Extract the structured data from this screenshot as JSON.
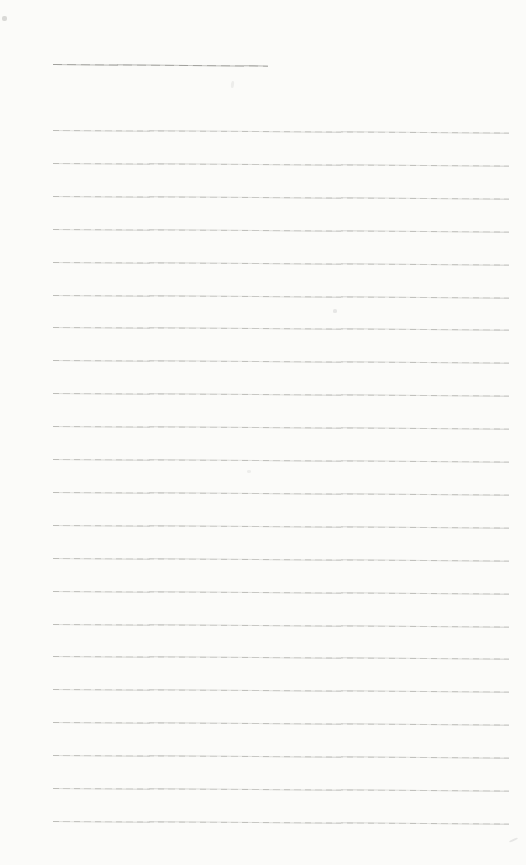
{
  "page": {
    "kind": "blank-lined-notebook-page",
    "width_px": 526,
    "height_px": 865,
    "background_color": "#fbfbf9",
    "rule_color": "#b2b2ad",
    "title_rule_color": "#9c9c97"
  },
  "title_line": {
    "x": 53,
    "y": 64,
    "width": 215,
    "tilt_deg": 0.45
  },
  "ruled_lines": {
    "count": 22,
    "x": 53,
    "width": 456,
    "first_y": 130,
    "spacing": 32.9,
    "tilt_deg": 0.3
  },
  "specks": [
    {
      "x": 2,
      "y": 16,
      "w": 5,
      "h": 5,
      "opacity": 0.3,
      "rotate_deg": 0
    },
    {
      "x": 231,
      "y": 81,
      "w": 3,
      "h": 7,
      "opacity": 0.12,
      "rotate_deg": 8
    },
    {
      "x": 333,
      "y": 309,
      "w": 4,
      "h": 4,
      "opacity": 0.18,
      "rotate_deg": 0
    },
    {
      "x": 247,
      "y": 470,
      "w": 4,
      "h": 3,
      "opacity": 0.12,
      "rotate_deg": 0
    },
    {
      "x": 509,
      "y": 839,
      "w": 9,
      "h": 2,
      "opacity": 0.18,
      "rotate_deg": -25
    }
  ]
}
